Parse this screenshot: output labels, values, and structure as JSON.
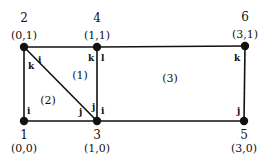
{
  "diagram": {
    "type": "finite-element-mesh",
    "colors": {
      "line": "#111111",
      "node": "#111111",
      "background": "#ffffff"
    },
    "nodes": [
      {
        "id": "1",
        "label": "1",
        "coord": "(0,0)",
        "x": 24,
        "y": 121
      },
      {
        "id": "2",
        "label": "2",
        "coord": "(0,1)",
        "x": 24,
        "y": 47
      },
      {
        "id": "3",
        "label": "3",
        "coord": "(1,0)",
        "x": 97,
        "y": 121
      },
      {
        "id": "4",
        "label": "4",
        "coord": "(1,1)",
        "x": 97,
        "y": 47
      },
      {
        "id": "5",
        "label": "5",
        "coord": "(3,0)",
        "x": 244,
        "y": 121
      },
      {
        "id": "6",
        "label": "6",
        "coord": "(3,1)",
        "x": 245,
        "y": 46
      }
    ],
    "edges": [
      {
        "from": "1",
        "to": "3"
      },
      {
        "from": "3",
        "to": "5"
      },
      {
        "from": "2",
        "to": "4"
      },
      {
        "from": "4",
        "to": "6"
      },
      {
        "from": "1",
        "to": "2"
      },
      {
        "from": "3",
        "to": "4"
      },
      {
        "from": "5",
        "to": "6"
      },
      {
        "from": "2",
        "to": "3"
      }
    ],
    "elements": [
      {
        "label": "(1)",
        "x": 80,
        "y": 79
      },
      {
        "label": "(2)",
        "x": 48,
        "y": 104
      },
      {
        "label": "(3)",
        "x": 170,
        "y": 82
      }
    ],
    "local_labels": [
      {
        "text": "i",
        "x": 38,
        "y": 63
      },
      {
        "text": "k",
        "x": 28,
        "y": 69
      },
      {
        "text": "k",
        "x": 88,
        "y": 61
      },
      {
        "text": "l",
        "x": 101,
        "y": 61
      },
      {
        "text": "k",
        "x": 234,
        "y": 61
      },
      {
        "text": "i",
        "x": 27,
        "y": 114
      },
      {
        "text": "j",
        "x": 79,
        "y": 115
      },
      {
        "text": "j",
        "x": 92,
        "y": 110
      },
      {
        "text": "i",
        "x": 101,
        "y": 114
      },
      {
        "text": "j",
        "x": 237,
        "y": 114
      }
    ]
  }
}
